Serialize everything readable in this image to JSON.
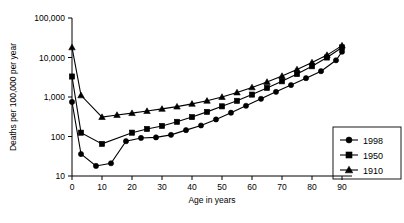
{
  "chart_data": {
    "type": "line",
    "title": "",
    "xlabel": "Age in years",
    "ylabel": "Deaths per 100,000 per year",
    "yscale": "log",
    "ylim": [
      10,
      100000
    ],
    "xlim": [
      0,
      92
    ],
    "grid": false,
    "legend_position": "right-bottom",
    "ytick_labels": [
      "100,000",
      "10,000",
      "1,000",
      "100",
      "10"
    ],
    "ytick_values": [
      100000,
      10000,
      1000,
      100,
      10
    ],
    "xtick_labels": [
      "0",
      "10",
      "20",
      "30",
      "40",
      "50",
      "60",
      "70",
      "80",
      "90"
    ],
    "xtick_values": [
      0,
      10,
      20,
      30,
      40,
      50,
      60,
      70,
      80,
      90
    ],
    "series": [
      {
        "name": "1998",
        "marker": "circle",
        "x": [
          0,
          3,
          8,
          13,
          18,
          23,
          28,
          33,
          38,
          43,
          48,
          53,
          58,
          63,
          68,
          73,
          78,
          83,
          88,
          90
        ],
        "values": [
          750,
          36,
          18,
          21,
          76,
          92,
          95,
          110,
          145,
          190,
          270,
          400,
          600,
          900,
          1350,
          2000,
          3000,
          4500,
          8500,
          14000
        ]
      },
      {
        "name": "1950",
        "marker": "square",
        "x": [
          0,
          3,
          10,
          20,
          25,
          30,
          35,
          40,
          45,
          50,
          55,
          60,
          65,
          70,
          75,
          80,
          85,
          90
        ],
        "values": [
          3300,
          125,
          65,
          125,
          155,
          185,
          235,
          310,
          420,
          580,
          800,
          1150,
          1700,
          2500,
          3800,
          6000,
          10000,
          18000
        ]
      },
      {
        "name": "1910",
        "marker": "triangle",
        "x": [
          0,
          3,
          10,
          15,
          20,
          25,
          30,
          35,
          40,
          45,
          50,
          55,
          60,
          65,
          70,
          75,
          80,
          85,
          90
        ],
        "values": [
          18000,
          1100,
          310,
          350,
          390,
          440,
          500,
          570,
          670,
          800,
          1000,
          1300,
          1750,
          2400,
          3400,
          5000,
          7500,
          11500,
          20000
        ]
      }
    ]
  },
  "legend": {
    "items": [
      {
        "label": "1998",
        "marker": "circle"
      },
      {
        "label": "1950",
        "marker": "square"
      },
      {
        "label": "1910",
        "marker": "triangle"
      }
    ]
  },
  "colors": {
    "ink": "#000000",
    "background": "#ffffff"
  }
}
